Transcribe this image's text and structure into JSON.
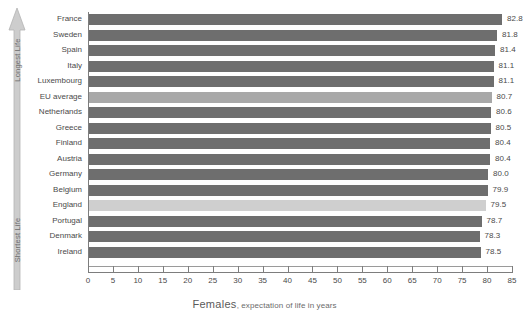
{
  "chart_data": {
    "type": "bar",
    "orientation": "horizontal",
    "title": "Females, expectation of life in years",
    "title_main": "Females",
    "title_sub": ", expectation of life in years",
    "xlabel": "",
    "ylabel": "",
    "xlim": [
      0,
      85
    ],
    "xticks": [
      0,
      5,
      10,
      15,
      20,
      25,
      30,
      35,
      40,
      45,
      50,
      55,
      60,
      65,
      70,
      75,
      80,
      85
    ],
    "grid": false,
    "legend": false,
    "categories": [
      "France",
      "Sweden",
      "Spain",
      "Italy",
      "Luxembourg",
      "EU average",
      "Netherlands",
      "Greece",
      "Finland",
      "Austria",
      "Germany",
      "Belgium",
      "England",
      "Portugal",
      "Denmark",
      "Ireland"
    ],
    "values": [
      82.8,
      81.8,
      81.4,
      81.1,
      81.1,
      80.7,
      80.6,
      80.5,
      80.4,
      80.4,
      80.0,
      79.9,
      79.5,
      78.7,
      78.3,
      78.5
    ],
    "value_labels": [
      "82.8",
      "81.8",
      "81.4",
      "81.1",
      "81.1",
      "80.7",
      "80.6",
      "80.5",
      "80.4",
      "80.4",
      "80.0",
      "79.9",
      "79.5",
      "78.7",
      "78.3",
      "78.5"
    ],
    "bar_styles": [
      "normal",
      "normal",
      "normal",
      "normal",
      "normal",
      "eu",
      "normal",
      "normal",
      "normal",
      "normal",
      "normal",
      "normal",
      "highlight",
      "normal",
      "normal",
      "normal"
    ],
    "colors": {
      "bar": "#6e6e6e",
      "bar_eu": "#a8a8a8",
      "bar_highlight": "#cfcfcf",
      "axis": "#7d7d7d",
      "text": "#4a4a4a"
    },
    "annotations": {
      "top": "Longest Life",
      "bottom": "Shortest Life"
    }
  }
}
